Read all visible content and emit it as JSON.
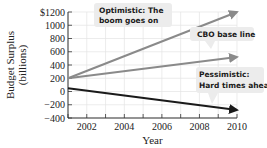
{
  "chart_data": {
    "type": "line",
    "title": "",
    "xlabel": "Year",
    "ylabel": "Budget Surplus (billions)",
    "ylabel_lines": [
      "Budget Surplus",
      "(billions)"
    ],
    "xlim": [
      2001,
      2010
    ],
    "ylim": [
      -400,
      1200
    ],
    "x_ticks": [
      2002,
      2004,
      2006,
      2008,
      2010
    ],
    "x_minor_ticks": [
      2001,
      2002,
      2003,
      2004,
      2005,
      2006,
      2007,
      2008,
      2009,
      2010
    ],
    "y_ticks": [
      -400,
      -200,
      0,
      200,
      400,
      600,
      800,
      1000,
      1200
    ],
    "y_tick_labels": [
      "−400",
      "−200",
      "0",
      "200",
      "400",
      "600",
      "800",
      "1000",
      "$1200"
    ],
    "grid": true,
    "series": [
      {
        "name": "Optimistic: The boom goes on",
        "x": [
          2001,
          2010
        ],
        "values": [
          200,
          1200
        ],
        "color": "#8a8a8a"
      },
      {
        "name": "CBO base line",
        "x": [
          2001,
          2010
        ],
        "values": [
          200,
          520
        ],
        "color": "#8a8a8a"
      },
      {
        "name": "Pessimistic: Hard times ahead",
        "x": [
          2001,
          2010
        ],
        "values": [
          50,
          -280
        ],
        "color": "#1a1a1a"
      }
    ],
    "annotations": [
      {
        "lines": [
          "Optimistic: The",
          "boom goes on"
        ],
        "series": "Optimistic"
      },
      {
        "lines": [
          "CBO base line"
        ],
        "series": "CBO base line"
      },
      {
        "lines": [
          "Pessimistic:",
          "Hard times ahead"
        ],
        "series": "Pessimistic"
      }
    ]
  }
}
